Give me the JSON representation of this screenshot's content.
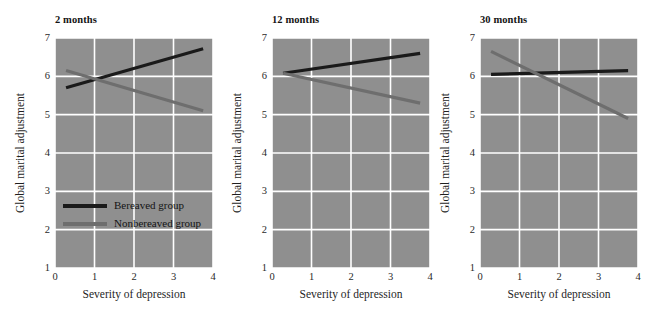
{
  "figure": {
    "background_color": "#ffffff",
    "plot_background_color": "#8f8f8f",
    "gridline_color": "#ffffff"
  },
  "legend": {
    "position": "inside-first-panel-lower-left",
    "entries": [
      {
        "label": "Bereaved group",
        "color": "#1a1a1a"
      },
      {
        "label": "Nonbereaved group",
        "color": "#6e6e6e"
      }
    ]
  },
  "axes": {
    "xlabel": "Severity of depression",
    "ylabel": "Global marital adjustment",
    "xticks": [
      "0",
      "1",
      "2",
      "3",
      "4"
    ],
    "yticks": [
      "1",
      "2",
      "3",
      "4",
      "5",
      "6",
      "7"
    ],
    "xlim": [
      0,
      4
    ],
    "ylim": [
      1,
      7
    ]
  },
  "chart_data": {
    "type": "line",
    "title": "",
    "xlabel": "Severity of depression",
    "ylabel": "Global marital adjustment",
    "xlim": [
      0,
      4
    ],
    "ylim": [
      1,
      7
    ],
    "grid": true,
    "legend": [
      "Bereaved group",
      "Nonbereaved group"
    ],
    "legend_position": "lower-left of first panel",
    "panels": [
      {
        "title": "2 months",
        "series": [
          {
            "name": "Bereaved group",
            "color": "#1a1a1a",
            "x": [
              0.28,
              3.75
            ],
            "y": [
              5.7,
              6.72
            ]
          },
          {
            "name": "Nonbereaved group",
            "color": "#6e6e6e",
            "x": [
              0.28,
              3.75
            ],
            "y": [
              6.15,
              5.1
            ]
          }
        ]
      },
      {
        "title": "12 months",
        "series": [
          {
            "name": "Bereaved group",
            "color": "#1a1a1a",
            "x": [
              0.28,
              3.75
            ],
            "y": [
              6.08,
              6.6
            ]
          },
          {
            "name": "Nonbereaved group",
            "color": "#6e6e6e",
            "x": [
              0.28,
              3.75
            ],
            "y": [
              6.08,
              5.3
            ]
          }
        ]
      },
      {
        "title": "30 months",
        "series": [
          {
            "name": "Bereaved group",
            "color": "#1a1a1a",
            "x": [
              0.28,
              3.75
            ],
            "y": [
              6.05,
              6.15
            ]
          },
          {
            "name": "Nonbereaved group",
            "color": "#6e6e6e",
            "x": [
              0.28,
              3.75
            ],
            "y": [
              6.65,
              4.9
            ]
          }
        ]
      }
    ]
  }
}
